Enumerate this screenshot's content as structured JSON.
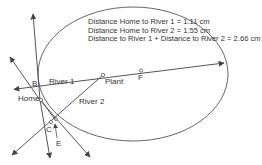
{
  "colors": {
    "line": "#555555",
    "circle": "#666666",
    "text": "#333333",
    "background": "#ffffff"
  },
  "info": {
    "lines": [
      "Distance Home to River 1 = 1.11 cm",
      "Distance Home to River 2 = 1.55 cm",
      "Distance to River 1 + Distance to River 2 = 2.66 cm"
    ]
  },
  "labels": {
    "river1": "River 1",
    "river2": "River 2",
    "home": "Home",
    "plant": "Plant",
    "b": "B",
    "c": "C",
    "e": "E",
    "f": "F"
  }
}
